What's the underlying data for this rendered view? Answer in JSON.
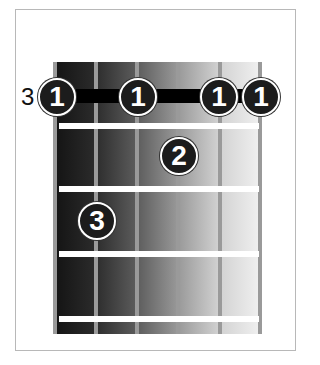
{
  "diagram": {
    "type": "guitar-chord-diagram",
    "starting_fret_label": "3",
    "strings": 6,
    "frets_shown": 4,
    "barre": {
      "fret": 1,
      "from_string": 1,
      "to_string": 6,
      "finger": "1"
    },
    "fingers": [
      {
        "label": "1",
        "string": 1,
        "fret": 1
      },
      {
        "label": "1",
        "string": 3,
        "fret": 1
      },
      {
        "label": "1",
        "string": 5,
        "fret": 1
      },
      {
        "label": "1",
        "string": 6,
        "fret": 1
      },
      {
        "label": "2",
        "string": 4,
        "fret": 2
      },
      {
        "label": "3",
        "string": 2,
        "fret": 3
      }
    ],
    "colors": {
      "dot_fill": "#1c1c1c",
      "dot_text": "#ffffff",
      "string": "#9a9a9a",
      "fret": "#ffffff",
      "barre": "#000000"
    }
  }
}
